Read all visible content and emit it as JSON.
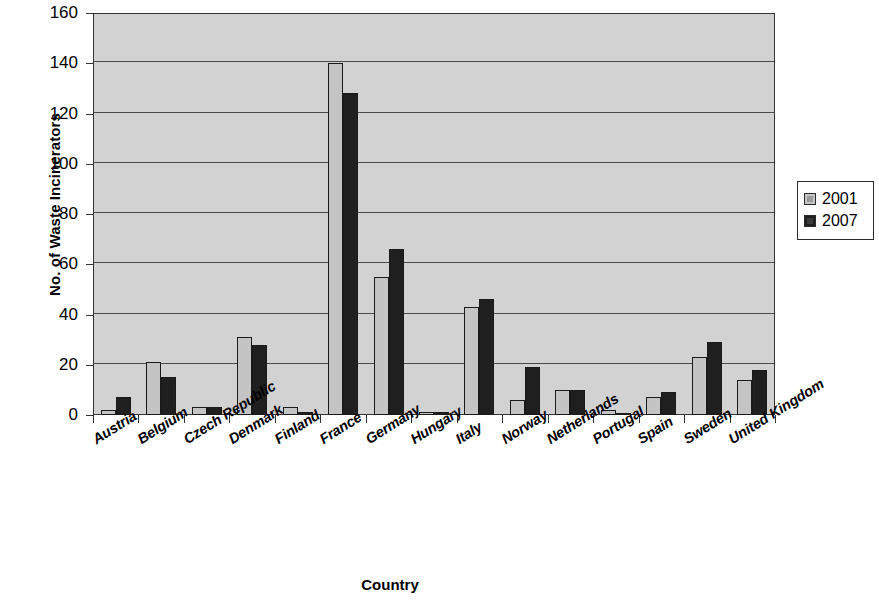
{
  "chart_data": {
    "type": "bar",
    "title": "",
    "xlabel": "Country",
    "ylabel": "No. of Waste Incinerators",
    "ylim": [
      0,
      160
    ],
    "ytick_interval": 20,
    "yticks": [
      0,
      20,
      40,
      60,
      80,
      100,
      120,
      140,
      160
    ],
    "grid": true,
    "legend_position": "right",
    "categories": [
      "Austria",
      "Belgium",
      "Czech Republic",
      "Denmark",
      "Finland",
      "France",
      "Germany",
      "Hungary",
      "Italy",
      "Norway",
      "Netherlands",
      "Portugal",
      "Spain",
      "Sweden",
      "United Kingdom"
    ],
    "series": [
      {
        "name": "2001",
        "color": "#c4c4c4",
        "values": [
          2,
          21,
          3,
          31,
          3,
          140,
          55,
          1,
          43,
          6,
          10,
          2,
          7,
          23,
          14
        ]
      },
      {
        "name": "2007",
        "color": "#1f1f1f",
        "values": [
          7,
          15,
          3,
          28,
          1,
          128,
          66,
          1,
          46,
          19,
          10,
          0,
          9,
          29,
          18
        ]
      }
    ]
  },
  "legend": {
    "entries": [
      {
        "label": "2001"
      },
      {
        "label": "2007"
      }
    ]
  }
}
